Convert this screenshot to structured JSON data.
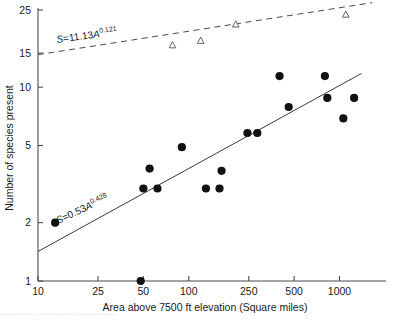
{
  "chart_data": {
    "type": "scatter",
    "title": "",
    "xlabel": "Area above 7500 ft elevation (Square miles)",
    "ylabel": "Number of species present",
    "xscale": "log",
    "yscale": "log",
    "xlim": [
      10,
      1800
    ],
    "ylim": [
      1,
      25
    ],
    "grid": false,
    "legend": "none",
    "xticks": [
      10,
      25,
      50,
      100,
      250,
      500,
      1000
    ],
    "xtick_labels": [
      "10",
      "25",
      "50",
      "100",
      "250",
      "500",
      "1000"
    ],
    "yticks": [
      1,
      2,
      5,
      10,
      15,
      25
    ],
    "ytick_labels": [
      "1",
      "2",
      "5",
      "10",
      "15",
      "25"
    ],
    "series": [
      {
        "name": "Mammal species (filled circles)",
        "marker": "filled-circle",
        "color": "#111111",
        "points": [
          {
            "x": 13,
            "y": 2.0
          },
          {
            "x": 48,
            "y": 1.0
          },
          {
            "x": 50,
            "y": 3.0
          },
          {
            "x": 55,
            "y": 3.8
          },
          {
            "x": 62,
            "y": 3.0
          },
          {
            "x": 90,
            "y": 4.9
          },
          {
            "x": 130,
            "y": 3.0
          },
          {
            "x": 160,
            "y": 3.0
          },
          {
            "x": 165,
            "y": 3.7
          },
          {
            "x": 245,
            "y": 5.8
          },
          {
            "x": 285,
            "y": 5.8
          },
          {
            "x": 400,
            "y": 11.4
          },
          {
            "x": 460,
            "y": 7.9
          },
          {
            "x": 800,
            "y": 11.4
          },
          {
            "x": 830,
            "y": 8.8
          },
          {
            "x": 1060,
            "y": 6.9
          },
          {
            "x": 1250,
            "y": 8.8
          }
        ]
      },
      {
        "name": "Comparison sites (open triangles)",
        "marker": "open-triangle",
        "color": "#555555",
        "points": [
          {
            "x": 78,
            "y": 16.4
          },
          {
            "x": 120,
            "y": 17.3
          },
          {
            "x": 205,
            "y": 21.0
          },
          {
            "x": 1100,
            "y": 23.6
          }
        ]
      }
    ],
    "fits": [
      {
        "name": "mammal-regression",
        "style": "solid",
        "equation_text": "S = 0.53A^0.428",
        "coefficient": 0.53,
        "exponent": 0.428,
        "label_parts": {
          "lead": "S",
          "eq": "=",
          "coef": "0.53",
          "var": "A",
          "exp": "0.428"
        },
        "x_start": 10,
        "x_end": 1400,
        "label_x": 58,
        "label_y": 224,
        "label_rotation": -25
      },
      {
        "name": "reference-regression",
        "style": "dashed",
        "equation_text": "S = 11.13A^0.121",
        "coefficient": 11.13,
        "exponent": 0.121,
        "label_parts": {
          "lead": "S",
          "eq": "=",
          "coef": "11.13",
          "var": "A",
          "exp": "0.121"
        },
        "x_start": 10,
        "x_end": 1650,
        "label_x": 57,
        "label_y": 43,
        "label_rotation": -8
      }
    ]
  },
  "axes": {
    "x_title": "Area above 7500 ft elevation (Square miles)",
    "y_title": "Number of species present"
  },
  "colors": {
    "axis": "#4a4a4a",
    "marker_filled": "#111111",
    "marker_open_stroke": "#555555",
    "fit_line": "#3a3a3a",
    "text": "#1a1a1a",
    "background": "#ffffff"
  },
  "page_artifact": {
    "bottom_text": "..........................................."
  }
}
